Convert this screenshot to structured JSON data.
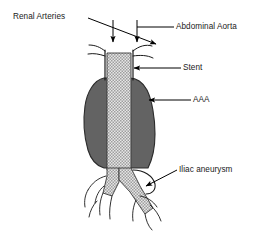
{
  "figure": {
    "background_color": "#ffffff",
    "labels": {
      "renal_arteries": "Renal Arteries",
      "abdominal_aorta": "Abdominal Aorta",
      "stent": "Stent",
      "aaa": "AAA",
      "iliac_aneurysm": "Iliac aneurysm"
    },
    "colors": {
      "aneurysm_sac": "#636363",
      "vessel_outline": "#1a1a1a",
      "stent_light": "#e3e3e3",
      "stent_dark": "#9a9a9a",
      "leader_line": "#000000",
      "text": "#1a1a1a"
    },
    "anatomy": {
      "aortic_neck": "aortic-neck",
      "renal_artery_left": "renal-artery-left",
      "renal_artery_right": "renal-artery-right",
      "aneurysm_sac": "aneurysm-sac",
      "stent_graft_body": "stent-graft-body",
      "stent_limb_left": "stent-limb-left",
      "stent_limb_right": "stent-limb-right",
      "iliac_aneurysm_bulge": "iliac-aneurysm-bulge",
      "branch_vessels": "distal-branch-vessels"
    }
  }
}
